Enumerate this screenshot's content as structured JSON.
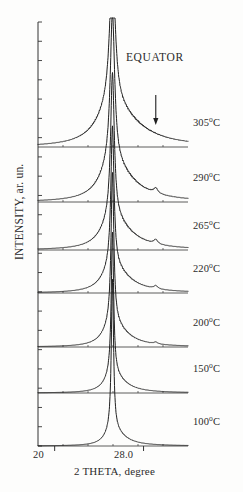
{
  "figure": {
    "annotation": "EQUATOR",
    "arrow_marker": "down-arrow"
  },
  "axes": {
    "ylabel": "INTENSITY, ar. un.",
    "xlabel": "2 THETA, degree",
    "xticklabels": [
      "20",
      "28.0"
    ]
  },
  "chart_data": {
    "type": "line",
    "title": "",
    "subtitle": "",
    "xlabel": "2 THETA, degree",
    "ylabel": "INTENSITY, ar. un.",
    "xlim": [
      18.5,
      32.0
    ],
    "ylim": [
      0,
      1
    ],
    "xticks": [
      20,
      28.0
    ],
    "xticklabels": [
      "20",
      "28.0"
    ],
    "yticks": [],
    "yticklabels": [],
    "grid": false,
    "legend_position": "right-inline",
    "annotations": [
      {
        "text": "EQUATOR",
        "x": 28.6,
        "y": 0.93
      },
      {
        "text": "down-arrow",
        "x": 29.1,
        "y": 0.8,
        "type": "arrow"
      }
    ],
    "series_note": "Seven stacked X-ray diffraction equatorial scans, each offset vertically; sharp Bragg reflection near 2-theta = 25.2 degrees; weak shoulder near 2-theta = 29.1 degrees marked by arrow on upper traces.",
    "peak_center_2theta": 25.2,
    "shoulder_2theta": 29.1,
    "series": [
      {
        "name": "305°C",
        "label": "305",
        "unit": "°C",
        "baseline_y": 147,
        "peak_height": 140,
        "peak_width": 0.3,
        "tail_width": 2.6,
        "tail_amp": 0.3,
        "shoulder_amp": 0.0,
        "values_note": "broad diffuse halo with sharp central reflection"
      },
      {
        "name": "290°C",
        "label": "290",
        "unit": "°C",
        "baseline_y": 202,
        "peak_height": 150,
        "peak_width": 0.24,
        "tail_width": 2.1,
        "tail_amp": 0.26,
        "shoulder_amp": 0.035,
        "values_note": "sharp reflection plus small shoulder near 29.1 deg"
      },
      {
        "name": "265°C",
        "label": "265",
        "unit": "°C",
        "baseline_y": 250,
        "peak_height": 145,
        "peak_width": 0.2,
        "tail_width": 1.9,
        "tail_amp": 0.22,
        "shoulder_amp": 0.03,
        "values_note": "sharp reflection plus small shoulder near 29.1 deg"
      },
      {
        "name": "220°C",
        "label": "220",
        "unit": "°C",
        "baseline_y": 293,
        "peak_height": 140,
        "peak_width": 0.17,
        "tail_width": 1.7,
        "tail_amp": 0.19,
        "shoulder_amp": 0.022,
        "values_note": "sharp reflection, weak shoulder"
      },
      {
        "name": "200°C",
        "label": "200",
        "unit": "°C",
        "baseline_y": 347,
        "peak_height": 150,
        "peak_width": 0.15,
        "tail_width": 1.5,
        "tail_amp": 0.16,
        "shoulder_amp": 0.012,
        "values_note": "sharp reflection, very weak shoulder"
      },
      {
        "name": "150°C",
        "label": "150",
        "unit": "°C",
        "baseline_y": 393,
        "peak_height": 142,
        "peak_width": 0.13,
        "tail_width": 1.3,
        "tail_amp": 0.13,
        "shoulder_amp": 0.0,
        "values_note": "sharp reflection only"
      },
      {
        "name": "100°C",
        "label": "100",
        "unit": "°C",
        "baseline_y": 446,
        "peak_height": 150,
        "peak_width": 0.12,
        "tail_width": 1.2,
        "tail_amp": 0.11,
        "shoulder_amp": 0.0,
        "values_note": "sharp reflection only"
      }
    ]
  },
  "colors": {
    "line": "#1f1f1f",
    "axis": "#333333",
    "background": "#fdfdfc",
    "text": "#2b2b2b"
  }
}
